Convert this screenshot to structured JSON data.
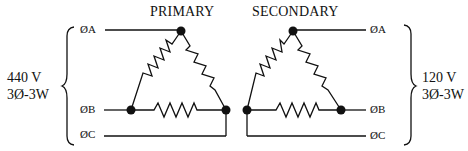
{
  "titles": {
    "primary": "PRIMARY",
    "secondary": "SECONDARY"
  },
  "primary_side": {
    "voltage": "440 V",
    "config": "3Ø-3W",
    "phases": [
      "ØA",
      "ØB",
      "ØC"
    ]
  },
  "secondary_side": {
    "voltage": "120 V",
    "config": "3Ø-3W",
    "phases": [
      "ØA",
      "ØB",
      "ØC"
    ]
  },
  "colors": {
    "line": "#111111",
    "background": "#ffffff"
  }
}
